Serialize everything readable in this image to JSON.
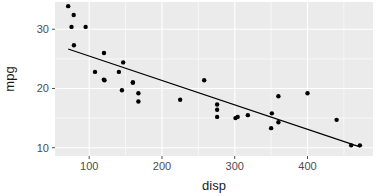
{
  "chart_data": {
    "type": "scatter",
    "title": "",
    "subtitle": "",
    "xlabel": "disp",
    "ylabel": "mpg",
    "xlim": [
      53,
      490
    ],
    "ylim": [
      8.6,
      34.6
    ],
    "x_ticks": [
      100,
      200,
      300,
      400
    ],
    "y_ticks": [
      10,
      20,
      30
    ],
    "x_tick_labels": [
      "100",
      "200",
      "300",
      "400"
    ],
    "y_tick_labels": [
      "10",
      "20",
      "30"
    ],
    "x_minor_ticks": [
      150,
      250,
      350,
      450
    ],
    "y_minor_ticks": [
      15,
      25,
      30
    ],
    "grid": true,
    "legend": "none",
    "point_color": "#000000",
    "point_size": 2.2,
    "panel_background": "#ebebeb",
    "grid_color": "#ffffff",
    "axis_text_color": "#4d4d4d",
    "axis_title_color": "#1a1a1a",
    "x": [
      160,
      160,
      108,
      258,
      360,
      225,
      360,
      146.7,
      140.8,
      167.6,
      167.6,
      275.8,
      275.8,
      275.8,
      472,
      460,
      440,
      78.7,
      75.7,
      71.1,
      120.1,
      318,
      304,
      350,
      400,
      79,
      120.3,
      95.1,
      351,
      145,
      301,
      121
    ],
    "y": [
      21.0,
      21.0,
      22.8,
      21.4,
      18.7,
      18.1,
      14.3,
      24.4,
      22.8,
      19.2,
      17.8,
      16.4,
      17.3,
      15.2,
      10.4,
      10.4,
      14.7,
      32.4,
      30.4,
      33.9,
      21.5,
      15.5,
      15.2,
      13.3,
      19.2,
      27.3,
      26.0,
      30.4,
      15.8,
      19.7,
      15.0,
      21.4
    ],
    "series": [
      {
        "name": "mtcars",
        "points": [
          [
            160,
            21.0
          ],
          [
            160,
            21.0
          ],
          [
            108,
            22.8
          ],
          [
            258,
            21.4
          ],
          [
            360,
            18.7
          ],
          [
            225,
            18.1
          ],
          [
            360,
            14.3
          ],
          [
            146.7,
            24.4
          ],
          [
            140.8,
            22.8
          ],
          [
            167.6,
            19.2
          ],
          [
            167.6,
            17.8
          ],
          [
            275.8,
            16.4
          ],
          [
            275.8,
            17.3
          ],
          [
            275.8,
            15.2
          ],
          [
            472,
            10.4
          ],
          [
            460,
            10.4
          ],
          [
            440,
            14.7
          ],
          [
            78.7,
            32.4
          ],
          [
            75.7,
            30.4
          ],
          [
            71.1,
            33.9
          ],
          [
            120.1,
            21.5
          ],
          [
            318,
            15.5
          ],
          [
            304,
            15.2
          ],
          [
            350,
            13.3
          ],
          [
            400,
            19.2
          ],
          [
            79,
            27.3
          ],
          [
            120.3,
            26.0
          ],
          [
            95.1,
            30.4
          ],
          [
            351,
            15.8
          ],
          [
            145,
            19.7
          ],
          [
            301,
            15.0
          ],
          [
            121,
            21.4
          ]
        ]
      }
    ],
    "fit_line": {
      "type": "linear",
      "intercept": 29.599855,
      "slope": -0.0412151,
      "x_start": 71.1,
      "x_end": 472,
      "y_start": 26.67,
      "y_end": 10.15
    }
  },
  "axes": {
    "x_axis_label": "disp",
    "y_axis_label": "mpg"
  }
}
